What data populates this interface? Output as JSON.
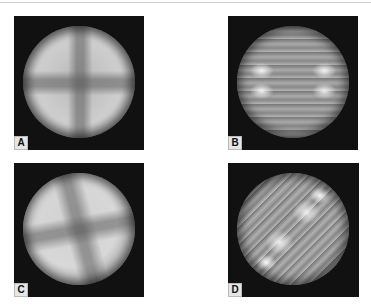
{
  "figure": {
    "panels": [
      {
        "id": "A",
        "label": "A",
        "pattern": "smooth disc with faint central cross"
      },
      {
        "id": "B",
        "label": "B",
        "pattern": "horizontal fringe bands with bright lobes left and right"
      },
      {
        "id": "C",
        "label": "C",
        "pattern": "smooth disc with tilted faint cross"
      },
      {
        "id": "D",
        "label": "D",
        "pattern": "diagonal fringe bands with bright lobes along diagonal"
      }
    ]
  }
}
